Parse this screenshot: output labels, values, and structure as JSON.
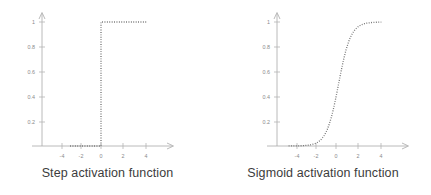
{
  "figure": {
    "background_color": "#ffffff",
    "axis_color": "#a8a8a8",
    "curve_color": "#6e6e6e",
    "tick_label_color": "#8a8a8a",
    "caption_color": "#3c3c3c"
  },
  "panels": [
    {
      "id": "step",
      "caption": "Step activation function",
      "y_axis_arrow": "arrow-up-icon",
      "x_axis_arrow": "arrow-right-icon"
    },
    {
      "id": "sigmoid",
      "caption": "Sigmoid activation function",
      "y_axis_arrow": "arrow-up-icon",
      "x_axis_arrow": "arrow-right-icon"
    }
  ],
  "chart_data": [
    {
      "type": "line",
      "id": "step-activation-function",
      "title": "Step activation function",
      "xlabel": "",
      "ylabel": "",
      "xlim": [
        -5.6,
        5.0
      ],
      "ylim": [
        -0.06,
        1.12
      ],
      "grid": false,
      "legend": "none",
      "line_style": "dotted",
      "xticks": [
        -4,
        -2,
        0,
        2,
        4
      ],
      "xtick_labels": [
        "-4",
        "-2",
        "0",
        "2",
        "4"
      ],
      "yticks": [
        0.2,
        0.4,
        0.6,
        0.8,
        1
      ],
      "ytick_labels": [
        "0.2",
        "0.4",
        "0.6",
        "0.8",
        "1"
      ],
      "description": "Heaviside step: y = 0 for x < 0, y = 1 for x >= 0. Vertical dotted riser drawn at x = 0.",
      "x": [
        -3.0,
        -2.5,
        -2.0,
        -1.5,
        -1.0,
        -0.5,
        0.0,
        0.0,
        0.5,
        1.0,
        1.5,
        2.0,
        2.5,
        3.0,
        3.5,
        4.0,
        4.4
      ],
      "y": [
        0.0,
        0.0,
        0.0,
        0.0,
        0.0,
        0.0,
        0.0,
        1.0,
        1.0,
        1.0,
        1.0,
        1.0,
        1.0,
        1.0,
        1.0,
        1.0,
        1.0
      ]
    },
    {
      "type": "line",
      "id": "sigmoid-activation-function",
      "title": "Sigmoid activation function",
      "xlabel": "",
      "ylabel": "",
      "xlim": [
        -5.6,
        5.0
      ],
      "ylim": [
        -0.06,
        1.12
      ],
      "grid": false,
      "legend": "none",
      "line_style": "dotted",
      "xticks": [
        -4,
        -2,
        0,
        2,
        4
      ],
      "xtick_labels": [
        "-4",
        "-2",
        "0",
        "2",
        "4"
      ],
      "yticks": [
        0.2,
        0.4,
        0.6,
        0.8,
        1
      ],
      "ytick_labels": [
        "0.2",
        "0.4",
        "0.6",
        "0.8",
        "1"
      ],
      "description": "Logistic sigmoid y = 1 / (1 + exp(-k(x - x0))) with k approximately 1.7 and midpoint near x = 0.25.",
      "x": [
        -4.6,
        -4.2,
        -3.8,
        -3.4,
        -3.0,
        -2.6,
        -2.2,
        -1.8,
        -1.4,
        -1.0,
        -0.6,
        -0.2,
        0.2,
        0.6,
        1.0,
        1.4,
        1.8,
        2.2,
        2.6,
        3.0,
        3.4,
        3.8,
        4.2,
        4.4
      ],
      "y": [
        0.0003,
        0.0007,
        0.0013,
        0.0026,
        0.0051,
        0.0101,
        0.0199,
        0.0388,
        0.0742,
        0.1383,
        0.2459,
        0.4038,
        0.5794,
        0.7357,
        0.8502,
        0.9214,
        0.9601,
        0.9795,
        0.9897,
        0.9948,
        0.9974,
        0.9987,
        0.9993,
        0.9995
      ]
    }
  ]
}
